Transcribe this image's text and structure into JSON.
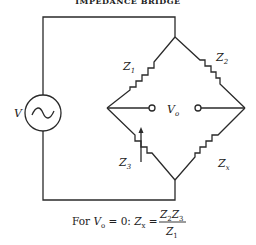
{
  "title": "IMPEDANCE BRIDGE",
  "source": {
    "label": "V",
    "symbol": "ac-source"
  },
  "impedances": [
    {
      "id": "z1",
      "label": "Z",
      "sub": "1"
    },
    {
      "id": "z2",
      "label": "Z",
      "sub": "2"
    },
    {
      "id": "z3",
      "label": "Z",
      "sub": "3",
      "variable": true
    },
    {
      "id": "zx",
      "label": "Z",
      "sub": "x"
    }
  ],
  "output": {
    "label": "V",
    "sub": "o"
  },
  "caption": {
    "prefix": "For ",
    "v": "V",
    "v_sub": "o",
    "eq_zero": " = 0: ",
    "zx": "Z",
    "zx_sub": "x",
    "equals": " = ",
    "numerator_a": "Z",
    "numerator_a_sub": "2",
    "numerator_b": "Z",
    "numerator_b_sub": "3",
    "denominator": "Z",
    "denominator_sub": "1"
  }
}
